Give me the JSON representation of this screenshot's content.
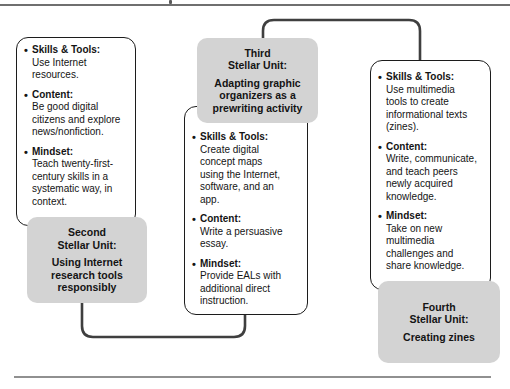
{
  "glyphs": {
    "bullet": "•"
  },
  "colors": {
    "unit_box_fill": "#d3d3d3",
    "detail_box_border": "#1c1c1c",
    "connector": "#3f3f3f",
    "top_rule": "#6f6f6f",
    "bottom_rule": "#909090",
    "text": "#141414"
  },
  "columns": {
    "left": {
      "items": [
        {
          "header": "Skills & Tools:",
          "body": "Use Internet\nresources."
        },
        {
          "header": "Content:",
          "body": "Be good digital\ncitizens and explore\nnews/nonfiction."
        },
        {
          "header": "Mindset:",
          "body": "Teach twenty-first-\ncentury skills in a\nsystematic way, in\ncontext."
        }
      ],
      "unit": {
        "title": "Second\nStellar Unit:",
        "subtitle": "Using Internet\nresearch tools\nresponsibly"
      }
    },
    "middle": {
      "unit": {
        "title": "Third\nStellar Unit:",
        "subtitle": "Adapting graphic\norganizers as a\nprewriting activity"
      },
      "items": [
        {
          "header": "Skills & Tools:",
          "body": "Create digital\nconcept maps\nusing the Internet,\nsoftware, and an\napp."
        },
        {
          "header": "Content:",
          "body": "Write a persuasive\nessay."
        },
        {
          "header": "Mindset:",
          "body": "Provide EALs with\nadditional direct\ninstruction."
        }
      ]
    },
    "right": {
      "items": [
        {
          "header": "Skills & Tools:",
          "body": "Use multimedia\ntools to create\ninformational texts\n(zines)."
        },
        {
          "header": "Content:",
          "body": "Write, communicate,\nand teach peers\nnewly acquired\nknowledge."
        },
        {
          "header": "Mindset:",
          "body": "Take on new\nmultimedia\nchallenges and\nshare knowledge."
        }
      ],
      "unit": {
        "title": "Fourth\nStellar Unit:",
        "subtitle": "Creating zines"
      }
    }
  }
}
